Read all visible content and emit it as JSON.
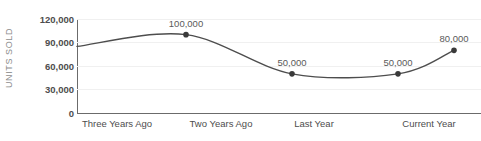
{
  "chart_data": {
    "type": "line",
    "title": "",
    "xlabel": "",
    "ylabel": "UNITS SOLD",
    "categories": [
      "Three Years Ago",
      "Two Years Ago",
      "Last Year",
      "Current Year"
    ],
    "series": [
      {
        "name": "Units Sold",
        "values": [
          100000,
          50000,
          50000,
          80000
        ],
        "point_labels": [
          "100,000",
          "50,000",
          "50,000",
          "80,000"
        ]
      }
    ],
    "ylim": [
      0,
      120000
    ],
    "yticks": [
      0,
      30000,
      60000,
      90000,
      120000
    ],
    "ytick_labels": [
      "0",
      "30,000",
      "60,000",
      "90,000",
      "120,000"
    ],
    "grid": "horizontal",
    "legend": "none",
    "line_color": "#4d4d4d",
    "marker_color": "#3a3a3a",
    "axis_color": "#6b6b6b",
    "grid_color": "#f0f0f0",
    "label_color": "#5a5a5a",
    "background": "#ffffff",
    "smoothing": "spline",
    "line_start_value": 85000
  }
}
